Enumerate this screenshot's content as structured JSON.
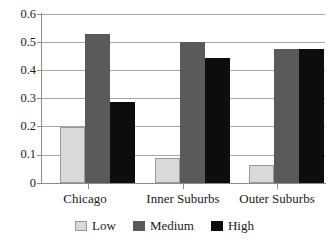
{
  "chart_data": {
    "type": "bar",
    "title": "",
    "xlabel": "",
    "ylabel": "",
    "categories": [
      "Chicago",
      "Inner Suburbs",
      "Outer Suburbs"
    ],
    "series": [
      {
        "name": "Low",
        "color": "#d9d9d9",
        "values": [
          0.2,
          0.088,
          0.065
        ]
      },
      {
        "name": "Medium",
        "color": "#5a5a5a",
        "values": [
          0.53,
          0.5,
          0.476
        ]
      },
      {
        "name": "High",
        "color": "#0d0d0d",
        "values": [
          0.286,
          0.445,
          0.476
        ]
      }
    ],
    "ylim": [
      0,
      0.6
    ],
    "ytick_labels": [
      "0.6",
      "0.5",
      "0.4",
      "0.3",
      "0.2",
      "0.1",
      "0"
    ],
    "ytick_values": [
      0.6,
      0.5,
      0.4,
      0.3,
      0.2,
      0.1,
      0
    ],
    "grid": true,
    "legend_position": "bottom"
  },
  "legend": {
    "entries": [
      {
        "label": "Low"
      },
      {
        "label": "Medium"
      },
      {
        "label": "High"
      }
    ]
  }
}
